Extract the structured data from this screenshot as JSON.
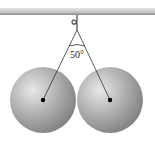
{
  "diagram": {
    "angle_label": "50°",
    "ceiling_color": "#b5b5b5",
    "sphere_color": "#9a9a9a",
    "objects": [
      "ceiling",
      "hook",
      "left-string",
      "right-string",
      "left-sphere",
      "right-sphere"
    ]
  }
}
